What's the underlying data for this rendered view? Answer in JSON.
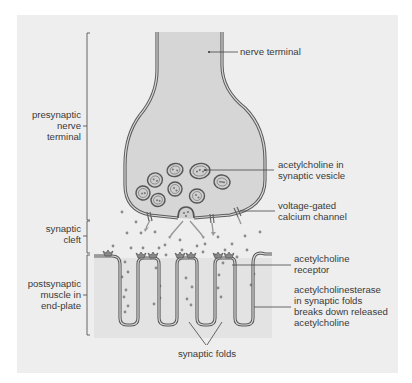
{
  "figure": {
    "background_color": "#ffffff",
    "panel_color": "#eeeeee",
    "terminal_fill": "#d8d8d8",
    "muscle_fill": "#e4e4e4",
    "membrane_color": "#5a5a5a"
  },
  "left_labels": {
    "presynaptic": [
      "presynaptic",
      "nerve",
      "terminal"
    ],
    "cleft": [
      "synaptic",
      "cleft"
    ],
    "postsynaptic": [
      "postsynaptic",
      "muscle in",
      "end-plate"
    ]
  },
  "right_labels": {
    "nerve_terminal": "nerve terminal",
    "vesicle": [
      "acetylcholine in",
      "synaptic vesicle"
    ],
    "calcium_channel": [
      "voltage-gated",
      "calcium channel"
    ],
    "receptor": [
      "acetylcholine",
      "receptor"
    ],
    "esterase": [
      "acetylcholinesterase",
      "in synaptic folds",
      "breaks down released",
      "acetylcholine"
    ]
  },
  "bottom_label": "synaptic folds"
}
